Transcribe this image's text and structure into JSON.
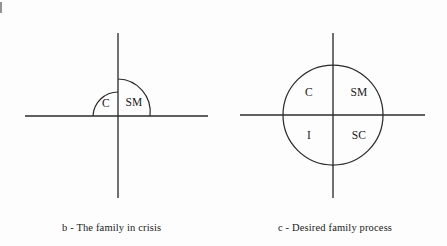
{
  "figure": {
    "background_color": "#fdfdfd",
    "line_color": "#2b2b2b",
    "text_color": "#1a1a1a"
  },
  "panels": [
    {
      "id": "panel-b",
      "caption": "b - The family in crisis",
      "shape": "semicircle-over-axis",
      "center": {
        "x": 118,
        "y": 116
      },
      "axes": {
        "horizontal": {
          "x1": 25,
          "x2": 208,
          "y": 116
        },
        "vertical": {
          "x": 118,
          "y1": 33,
          "y2": 198
        }
      },
      "arcs": [
        {
          "name": "left-arc",
          "label": "C",
          "baseline_x": 93,
          "apex_y": 92
        },
        {
          "name": "right-arc",
          "label": "SM",
          "baseline_x": 150,
          "apex_y": 79
        }
      ],
      "labels": [
        {
          "text": "C",
          "x": 106,
          "y": 104
        },
        {
          "text": "SM",
          "x": 133,
          "y": 103
        }
      ]
    },
    {
      "id": "panel-c",
      "caption": "c - Desired family process",
      "shape": "circle-over-axes",
      "center": {
        "x": 333,
        "y": 115
      },
      "radius": 50,
      "axes": {
        "horizontal": {
          "x1": 240,
          "x2": 425,
          "y": 115
        },
        "vertical": {
          "x": 333,
          "y1": 33,
          "y2": 198
        }
      },
      "labels": [
        {
          "text": "C",
          "x": 309,
          "y": 93,
          "quadrant": "upper-left"
        },
        {
          "text": "SM",
          "x": 358,
          "y": 93,
          "quadrant": "upper-right"
        },
        {
          "text": "I",
          "x": 309,
          "y": 135,
          "quadrant": "lower-left"
        },
        {
          "text": "SC",
          "x": 358,
          "y": 135,
          "quadrant": "lower-right"
        }
      ]
    }
  ]
}
